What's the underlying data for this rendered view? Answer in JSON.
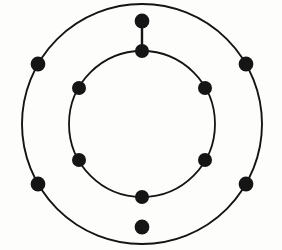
{
  "figure": {
    "background_color": "#fdfdfc",
    "stroke_color": "#141414",
    "vertex_color": "#151515",
    "width": 282,
    "height": 250
  },
  "chart_data": {
    "type": "diagram",
    "title": "",
    "subtitle": "",
    "xlabel": "",
    "ylabel": "",
    "grid": false,
    "legend": null,
    "annotations": [],
    "center": {
      "x": 142,
      "y": 124
    },
    "rings": [
      {
        "name": "outer-ring",
        "radius": 120,
        "stroke_width": 1.9,
        "vertex_count": 6,
        "vertex_radius": 7.4,
        "vertex_angles_deg": [
          -90,
          -30,
          30,
          90,
          150,
          210
        ],
        "vertices": [
          {
            "id": "o1",
            "angle_deg": -90,
            "x": 142,
            "y": 21
          },
          {
            "id": "o2",
            "angle_deg": -30,
            "x": 246,
            "y": 64
          },
          {
            "id": "o3",
            "angle_deg": 30,
            "x": 246,
            "y": 184
          },
          {
            "id": "o4",
            "angle_deg": 90,
            "x": 142,
            "y": 227
          },
          {
            "id": "o5",
            "angle_deg": 150,
            "x": 38,
            "y": 184
          },
          {
            "id": "o6",
            "angle_deg": 210,
            "x": 38,
            "y": 64
          }
        ]
      },
      {
        "name": "inner-ring",
        "radius": 73,
        "stroke_width": 1.8,
        "vertex_count": 6,
        "vertex_radius": 7.0,
        "vertex_angles_deg": [
          -90,
          -30,
          30,
          90,
          150,
          210
        ],
        "vertices": [
          {
            "id": "i1",
            "angle_deg": -90,
            "x": 142,
            "y": 51
          },
          {
            "id": "i2",
            "angle_deg": -30,
            "x": 205,
            "y": 88
          },
          {
            "id": "i3",
            "angle_deg": 30,
            "x": 205,
            "y": 160
          },
          {
            "id": "i4",
            "angle_deg": 90,
            "x": 142,
            "y": 197
          },
          {
            "id": "i5",
            "angle_deg": 150,
            "x": 79,
            "y": 160
          },
          {
            "id": "i6",
            "angle_deg": 210,
            "x": 79,
            "y": 88
          }
        ]
      }
    ],
    "spokes": [
      {
        "id": "spoke-top",
        "from": "o1",
        "to": "i1",
        "x1": 142,
        "y1": 21,
        "x2": 142,
        "y2": 51,
        "stroke_width": 2.4
      }
    ],
    "vertex_total": 12,
    "spoke_total": 1
  }
}
